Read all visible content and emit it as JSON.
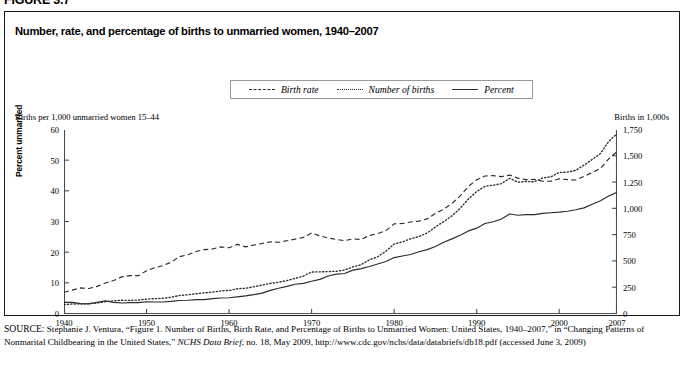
{
  "figure": {
    "number_label": "FIGURE 3.7",
    "title": "Number, rate, and percentage of births to unmarried women, 1940–2007"
  },
  "legend": {
    "position": "top-center",
    "items": [
      {
        "label": "Birth rate",
        "style": "dashed",
        "color": "#2b2b2b"
      },
      {
        "label": "Number of births",
        "style": "dotted",
        "color": "#2b2b2b"
      },
      {
        "label": "Percent",
        "style": "solid",
        "color": "#2b2b2b"
      }
    ]
  },
  "axes": {
    "left_caption": "Births per 1,000 unmarried women 15–44",
    "right_caption": "Births in 1,000s",
    "left_rotated_title": "Percent unmarried"
  },
  "source": {
    "prefix": "SOURCE:",
    "text_part1": " Stephanie J. Ventura, “Figure 1. Number of Births, Birth Rate, and Percentage of Births to Unmarried Women: United States, 1940–2007,” in “Changing Patterns of Nonmarital Childbearing in the United States,” ",
    "journal": "NCHS Data Brief",
    "text_part2": ", no. 18, May 2009, http://www.cdc.gov/nchs/data/databriefs/db18.pdf (accessed June 3, 2009)"
  },
  "chart_data": {
    "type": "line",
    "title": "Number, rate, and percentage of births to unmarried women, 1940–2007",
    "xlabel": "",
    "ylabel": "Births per 1,000 unmarried women 15–44",
    "ylabel_right": "Births in 1,000s",
    "xlim": [
      1940,
      2007
    ],
    "ylim": [
      0,
      60
    ],
    "ylim_right": [
      0,
      1750
    ],
    "grid": false,
    "legend_position": "top-center",
    "xticks": [
      1940,
      1950,
      1960,
      1970,
      1980,
      1990,
      2000,
      2007
    ],
    "xtick_labels": [
      "1940",
      "1950",
      "1960",
      "1970",
      "1980",
      "1990",
      "2000",
      "2007"
    ],
    "yticks_left": [
      0,
      10,
      20,
      30,
      40,
      50,
      60
    ],
    "ytick_labels_left": [
      "0",
      "10",
      "20",
      "30",
      "40",
      "50",
      "60"
    ],
    "yticks_right": [
      0,
      250,
      500,
      750,
      1000,
      1250,
      1500,
      1750
    ],
    "ytick_labels_right": [
      "0",
      "250",
      "500",
      "750",
      "1,000",
      "1,250",
      "1,500",
      "1,750"
    ],
    "x": [
      1940,
      1941,
      1942,
      1943,
      1944,
      1945,
      1946,
      1947,
      1948,
      1949,
      1950,
      1951,
      1952,
      1953,
      1954,
      1955,
      1956,
      1957,
      1958,
      1959,
      1960,
      1961,
      1962,
      1963,
      1964,
      1965,
      1966,
      1967,
      1968,
      1969,
      1970,
      1971,
      1972,
      1973,
      1974,
      1975,
      1976,
      1977,
      1978,
      1979,
      1980,
      1981,
      1982,
      1983,
      1984,
      1985,
      1986,
      1987,
      1988,
      1989,
      1990,
      1991,
      1992,
      1993,
      1994,
      1995,
      1996,
      1997,
      1998,
      1999,
      2000,
      2001,
      2002,
      2003,
      2004,
      2005,
      2006,
      2007
    ],
    "series": [
      {
        "name": "Birth rate",
        "axis": "left",
        "style": "dashed",
        "units": "births per 1,000 unmarried women aged 15-44",
        "values": [
          7.1,
          7.8,
          8.5,
          8.3,
          9.0,
          10.1,
          10.9,
          12.1,
          12.5,
          12.5,
          14.1,
          15.1,
          15.8,
          16.9,
          18.7,
          19.3,
          20.4,
          21.0,
          21.2,
          21.9,
          21.6,
          22.7,
          21.9,
          22.5,
          23.0,
          23.5,
          23.4,
          23.9,
          24.4,
          25.0,
          26.4,
          25.5,
          24.8,
          24.3,
          23.9,
          24.5,
          24.3,
          25.6,
          26.2,
          27.2,
          29.4,
          29.5,
          30.0,
          30.3,
          31.0,
          32.8,
          34.2,
          36.0,
          38.5,
          41.6,
          43.8,
          45.0,
          45.1,
          44.8,
          45.3,
          44.3,
          43.8,
          43.9,
          43.3,
          43.3,
          44.1,
          43.8,
          43.7,
          44.9,
          46.1,
          47.5,
          50.6,
          52.9
        ]
      },
      {
        "name": "Number of births",
        "axis": "right",
        "style": "dotted",
        "units": "thousands of births",
        "values": [
          89,
          95,
          96,
          98,
          105,
          117,
          125,
          131,
          129,
          133,
          142,
          146,
          150,
          160,
          176,
          183,
          193,
          201,
          208,
          220,
          224,
          240,
          245,
          259,
          275,
          291,
          302,
          318,
          339,
          360,
          399,
          401,
          403,
          407,
          418,
          448,
          468,
          516,
          544,
          598,
          666,
          686,
          715,
          737,
          770,
          828,
          878,
          933,
          1005,
          1094,
          1165,
          1214,
          1225,
          1240,
          1290,
          1254,
          1260,
          1257,
          1294,
          1305,
          1347,
          1349,
          1366,
          1416,
          1470,
          1527,
          1642,
          1715
        ]
      },
      {
        "name": "Percent",
        "axis": "left",
        "style": "solid",
        "units": "percent of all births to unmarried women",
        "values": [
          3.8,
          3.8,
          3.4,
          3.3,
          3.8,
          4.3,
          3.8,
          3.6,
          3.7,
          3.7,
          4.0,
          3.9,
          3.9,
          4.1,
          4.4,
          4.5,
          4.7,
          4.7,
          5.0,
          5.2,
          5.3,
          5.6,
          5.9,
          6.3,
          6.8,
          7.7,
          8.4,
          9.0,
          9.7,
          10.0,
          10.7,
          11.3,
          12.4,
          13.0,
          13.2,
          14.3,
          14.8,
          15.5,
          16.3,
          17.1,
          18.4,
          18.9,
          19.4,
          20.3,
          21.0,
          22.0,
          23.4,
          24.5,
          25.7,
          27.1,
          28.0,
          29.5,
          30.1,
          31.0,
          32.6,
          32.2,
          32.4,
          32.4,
          32.8,
          33.0,
          33.2,
          33.5,
          34.0,
          34.6,
          35.8,
          36.9,
          38.5,
          39.7
        ]
      }
    ]
  }
}
